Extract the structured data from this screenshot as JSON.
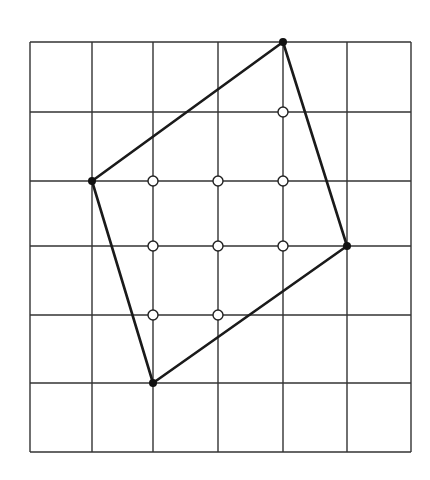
{
  "diagram": {
    "type": "lattice-polygon",
    "grid": {
      "columns": 6,
      "rows": 6,
      "x_lines": [
        30,
        92,
        153,
        218,
        283,
        347,
        411
      ],
      "y_lines": [
        42,
        112,
        181,
        246,
        315,
        383,
        452
      ],
      "line_color": "#333333"
    },
    "polygon": {
      "stroke_color": "#1a1a1a",
      "vertices": [
        {
          "col": 4,
          "row": 0,
          "label": "top"
        },
        {
          "col": 5,
          "row": 3,
          "label": "right"
        },
        {
          "col": 2,
          "row": 5,
          "label": "bottom"
        },
        {
          "col": 1,
          "row": 2,
          "label": "left"
        }
      ],
      "vertex_fill": "#111111"
    },
    "interior_points": [
      {
        "col": 4,
        "row": 1
      },
      {
        "col": 2,
        "row": 2
      },
      {
        "col": 3,
        "row": 2
      },
      {
        "col": 4,
        "row": 2
      },
      {
        "col": 2,
        "row": 3
      },
      {
        "col": 3,
        "row": 3
      },
      {
        "col": 4,
        "row": 3
      },
      {
        "col": 2,
        "row": 4
      },
      {
        "col": 3,
        "row": 4
      }
    ],
    "interior_point_count": 9,
    "boundary_point_count": 4
  }
}
